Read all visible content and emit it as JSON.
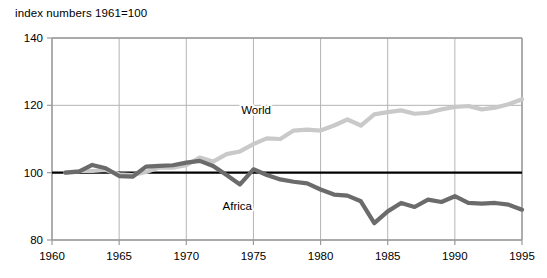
{
  "chart_data": {
    "type": "line",
    "title": "index numbers 1961=100",
    "xlabel": "",
    "ylabel": "",
    "xlim": [
      1960,
      1995
    ],
    "ylim": [
      80,
      140
    ],
    "xticks": [
      1960,
      1965,
      1970,
      1975,
      1980,
      1985,
      1990,
      1995
    ],
    "yticks": [
      80,
      100,
      120,
      140
    ],
    "grid": true,
    "legend_position": "inline-annotation",
    "reference_line": {
      "value": 100,
      "color": "#000000",
      "label": ""
    },
    "x": [
      1961,
      1962,
      1963,
      1964,
      1965,
      1966,
      1967,
      1968,
      1969,
      1970,
      1971,
      1972,
      1973,
      1974,
      1975,
      1976,
      1977,
      1978,
      1979,
      1980,
      1981,
      1982,
      1983,
      1984,
      1985,
      1986,
      1987,
      1988,
      1989,
      1990,
      1991,
      1992,
      1993,
      1994,
      1995
    ],
    "series": [
      {
        "name": "World",
        "color": "#c9c9c9",
        "label_x": 1975.2,
        "label_y": 117.5,
        "values": [
          100,
          100.5,
          100.5,
          100.8,
          99.5,
          99.3,
          100.2,
          101.5,
          101.5,
          102.2,
          104.5,
          103.3,
          105.5,
          106.3,
          108.5,
          110.2,
          110.0,
          112.5,
          112.8,
          112.5,
          114.0,
          115.8,
          114.0,
          117.3,
          118.0,
          118.5,
          117.5,
          117.8,
          118.8,
          119.5,
          119.8,
          118.8,
          119.3,
          120.3,
          121.8
        ]
      },
      {
        "name": "Africa",
        "color": "#6b6b6b",
        "label_x": 1973.8,
        "label_y": 89.0,
        "values": [
          100,
          100.3,
          102.3,
          101.3,
          99.0,
          98.8,
          101.8,
          102.0,
          102.2,
          103.0,
          103.5,
          102.0,
          99.3,
          96.5,
          101.0,
          99.3,
          98.0,
          97.3,
          96.8,
          95.0,
          93.5,
          93.2,
          91.5,
          85.0,
          88.5,
          91.0,
          89.8,
          92.0,
          91.3,
          93.0,
          91.0,
          90.8,
          91.0,
          90.5,
          89.0
        ]
      }
    ]
  },
  "axes": {
    "x_tick_labels": [
      "1960",
      "1965",
      "1970",
      "1975",
      "1980",
      "1985",
      "1990",
      "1995"
    ],
    "y_tick_labels": [
      "80",
      "100",
      "120",
      "140"
    ]
  },
  "style": {
    "grid_color": "#b4b4b4",
    "axis_color": "#9a9a9a",
    "reference_color": "#000000",
    "background": "#ffffff"
  }
}
